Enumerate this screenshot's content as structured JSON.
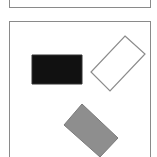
{
  "scene": {
    "panels": [
      {
        "name": "top-panel"
      },
      {
        "name": "main-panel"
      }
    ],
    "shapes": [
      {
        "name": "black-rectangle",
        "fill": "#111111",
        "stroke": "#333333",
        "points": "32,55 82,55 82,84 32,84"
      },
      {
        "name": "outlined-rectangle",
        "fill": "#ffffff",
        "stroke": "#8c8c8c",
        "points": "125,36 145,54 110,91 91,72"
      },
      {
        "name": "gray-rectangle",
        "fill": "#8e8e8e",
        "stroke": "#7a7a7a",
        "points": "82,104 118,138 100,157 64,125"
      }
    ]
  }
}
